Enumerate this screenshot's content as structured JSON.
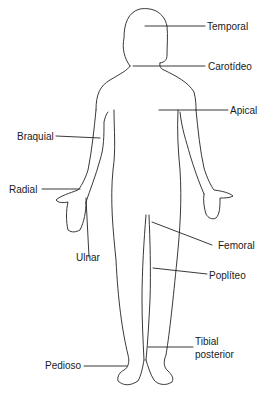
{
  "diagram": {
    "line_color": "#222222",
    "labels": {
      "temporal": "Temporal",
      "carotideo": "Carotídeo",
      "apical": "Apical",
      "braquial": "Braquial",
      "radial": "Radial",
      "ulnar": "Ulnar",
      "femoral": "Femoral",
      "popliteo": "Poplíteo",
      "tibial_1": "Tibial",
      "tibial_2": "posterior",
      "pedioso": "Pedioso"
    }
  }
}
